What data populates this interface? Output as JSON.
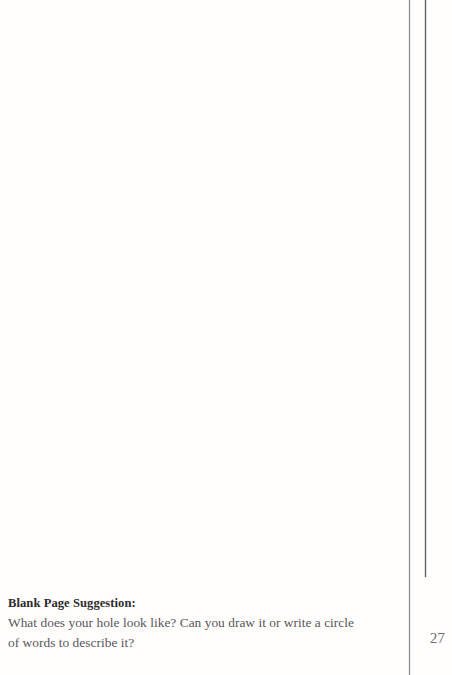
{
  "page": {
    "background_color": "#fffefd",
    "blank_area_label": "blank writing space"
  },
  "rules": {
    "outer_color": "#8d8d8f",
    "inner_color": "#5e5e60"
  },
  "footer_note": {
    "heading": "Blank Page Suggestion:",
    "body": "What does your hole look like? Can you draw it or write a circle of words to describe it?",
    "heading_color": "#2e2c2f",
    "body_color": "#58565b"
  },
  "folio": {
    "page_number": "27",
    "color": "#6b696d"
  }
}
